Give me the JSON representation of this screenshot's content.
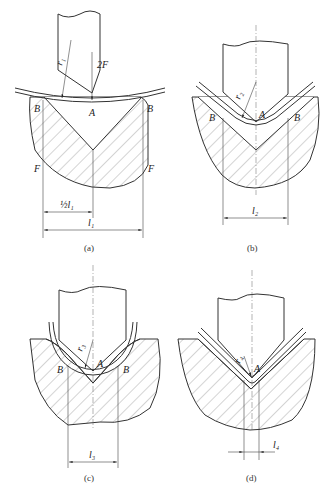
{
  "figure": {
    "panels": [
      {
        "id": "a",
        "caption": "(a)",
        "labels": {
          "radius": "r₁",
          "force_top": "2F",
          "point_A": "A",
          "point_B_left": "B",
          "point_B_right": "B",
          "force_left": "F",
          "force_right": "F",
          "half_span": "½l₁",
          "span": "l₁"
        }
      },
      {
        "id": "b",
        "caption": "(b)",
        "labels": {
          "radius": "r₂",
          "point_A": "A",
          "point_B_left": "B",
          "point_B_right": "B",
          "span": "l₂"
        }
      },
      {
        "id": "c",
        "caption": "(c)",
        "labels": {
          "radius": "r₃",
          "point_A": "A",
          "point_B_left": "B",
          "point_B_right": "B",
          "span": "l₃"
        }
      },
      {
        "id": "d",
        "caption": "(d)",
        "labels": {
          "radius": "r₄",
          "point_A": "A",
          "span": "l₄"
        }
      }
    ]
  }
}
